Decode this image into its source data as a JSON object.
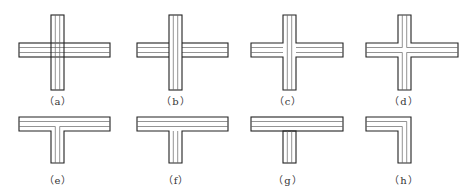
{
  "figure": {
    "stroke_color": "#222222",
    "inner_line_color": "#666666",
    "panels": [
      {
        "id": "a",
        "label": "（a）",
        "shape": "cross",
        "variant": "both-through",
        "cx": 57,
        "label_y": 93
      },
      {
        "id": "b",
        "label": "（b）",
        "shape": "cross",
        "variant": "vertical-through",
        "cx": 171,
        "label_y": 93
      },
      {
        "id": "c",
        "label": "（c）",
        "shape": "cross",
        "variant": "merged-outer",
        "cx": 287,
        "label_y": 93
      },
      {
        "id": "d",
        "label": "（d）",
        "shape": "cross",
        "variant": "merged-all",
        "cx": 403,
        "label_y": 93
      },
      {
        "id": "e",
        "label": "（e）",
        "shape": "tee",
        "variant": "merged-inner",
        "cx": 57,
        "label_y": 171
      },
      {
        "id": "f",
        "label": "（f）",
        "shape": "tee",
        "variant": "horizontal-through",
        "cx": 171,
        "label_y": 171
      },
      {
        "id": "g",
        "label": "（g）",
        "shape": "tee",
        "variant": "horizontal-through-stem-separate",
        "cx": 287,
        "label_y": 171
      },
      {
        "id": "h",
        "label": "（h）",
        "shape": "corner",
        "variant": "merged",
        "cx": 403,
        "label_y": 171
      }
    ]
  }
}
